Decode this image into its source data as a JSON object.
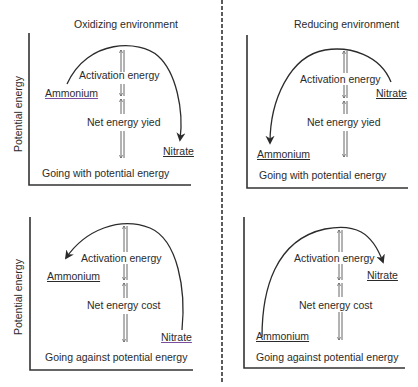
{
  "headers": {
    "left": "Oxidizing environment",
    "right": "Reducing environment"
  },
  "y_axis_label": "Potential energy",
  "panels": [
    {
      "id": "top-left",
      "environment": "Oxidizing environment",
      "start": "Ammonium",
      "end": "Nitrate",
      "activation": "Activation energy",
      "net": "Net energy yied",
      "caption": "Going with potential energy"
    },
    {
      "id": "top-right",
      "environment": "Reducing environment",
      "start": "Nitrate",
      "end": "Ammonium",
      "activation": "Activation energy",
      "net": "Net energy yied",
      "caption": "Going with potential energy"
    },
    {
      "id": "bottom-left",
      "environment": "Oxidizing environment",
      "start": "Nitrate",
      "end": "Ammonium",
      "activation": "Activation energy",
      "net": "Net energy cost",
      "caption": "Going against potential energy"
    },
    {
      "id": "bottom-right",
      "environment": "Reducing environment",
      "start": "Ammonium",
      "end": "Nitrate",
      "activation": "Activation energy",
      "net": "Net energy cost",
      "caption": "Going against potential energy"
    }
  ],
  "colors": {
    "ink": "#2b2b2b",
    "underline_accent": "#7a4fa0"
  }
}
